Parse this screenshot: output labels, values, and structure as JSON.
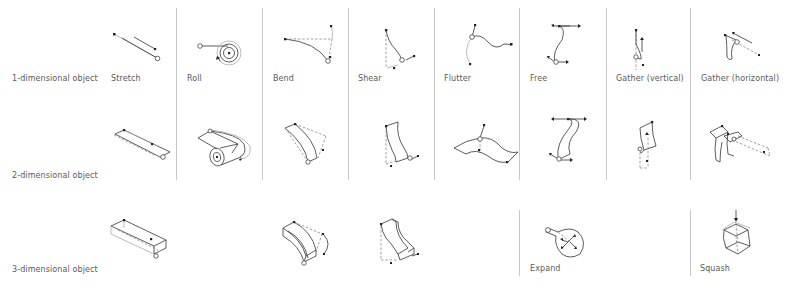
{
  "rows": [
    {
      "label": "1-dimensional object"
    },
    {
      "label": "2-dimensional object"
    },
    {
      "label": "3-dimensional object"
    }
  ],
  "columns": [
    {
      "label": "Stretch"
    },
    {
      "label": "Roll"
    },
    {
      "label": "Bend"
    },
    {
      "label": "Shear"
    },
    {
      "label": "Flutter"
    },
    {
      "label": "Free"
    },
    {
      "label": "Gather (vertical)"
    },
    {
      "label": "Gather (horizontal)"
    }
  ],
  "row3_labels": {
    "expand": "Expand",
    "squash": "Squash"
  },
  "figures": {
    "row1": [
      "stretch-line",
      "roll-line",
      "bend-line",
      "shear-line",
      "flutter-line",
      "free-line",
      "gather-vertical-line",
      "gather-horizontal-line"
    ],
    "row2": [
      "stretch-plane",
      "roll-plane",
      "bend-plane",
      "shear-plane",
      "flutter-plane",
      "free-plane",
      "gather-vertical-plane",
      "gather-horizontal-plane"
    ],
    "row3": [
      "stretch-box",
      "bend-box",
      "shear-box",
      "expand-balloon",
      "squash-cube"
    ]
  },
  "colors": {
    "line": "#333333",
    "divider": "#c8c8c8",
    "text": "#5a5a5a",
    "background": "#ffffff"
  }
}
